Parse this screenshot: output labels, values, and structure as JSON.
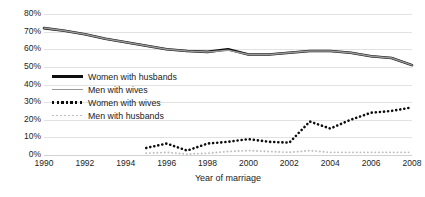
{
  "chart_data": {
    "type": "line",
    "title": "",
    "xlabel": "Year of marriage",
    "ylabel": "",
    "xlim": [
      1990,
      2008
    ],
    "ylim": [
      0,
      80
    ],
    "y_tick_labels": [
      "80%",
      "70%",
      "60%",
      "50%",
      "40%",
      "30%",
      "20%",
      "10%",
      "0%"
    ],
    "y_tick_values": [
      80,
      70,
      60,
      50,
      40,
      30,
      20,
      10,
      0
    ],
    "x_tick_labels": [
      "1990",
      "1992",
      "1994",
      "1996",
      "1998",
      "2000",
      "2002",
      "2004",
      "2006",
      "2008"
    ],
    "x_tick_values": [
      1990,
      1992,
      1994,
      1996,
      1998,
      2000,
      2002,
      2004,
      2006,
      2008
    ],
    "grid": "horizontal",
    "legend_position": "inside-left",
    "series": [
      {
        "name": "Women with husbands",
        "style": "solid-thick",
        "color": "#0d0d0d",
        "x": [
          1990,
          1991,
          1992,
          1993,
          1994,
          1995,
          1996,
          1997,
          1998,
          1999,
          2000,
          2001,
          2002,
          2003,
          2004,
          2005,
          2006,
          2007,
          2008
        ],
        "values": [
          72,
          70.5,
          68.5,
          66,
          64,
          62,
          60,
          59,
          58.5,
          60,
          57,
          57,
          58,
          59,
          59,
          58,
          56,
          55,
          51
        ]
      },
      {
        "name": "Men with wives",
        "style": "solid-thin",
        "color": "#9a9a9a",
        "x": [
          1990,
          1991,
          1992,
          1993,
          1994,
          1995,
          1996,
          1997,
          1998,
          1999,
          2000,
          2001,
          2002,
          2003,
          2004,
          2005,
          2006,
          2007,
          2008
        ],
        "values": [
          72,
          70.5,
          68.5,
          66,
          64,
          62,
          60,
          59,
          58.5,
          59.5,
          57,
          57,
          58,
          59,
          59,
          58,
          56,
          55,
          51
        ]
      },
      {
        "name": "Women with wives",
        "style": "dotted-thick",
        "color": "#0d0d0d",
        "x": [
          1995,
          1996,
          1997,
          1998,
          1999,
          2000,
          2001,
          2002,
          2003,
          2004,
          2005,
          2006,
          2007,
          2008
        ],
        "values": [
          4,
          6.5,
          2.5,
          6.5,
          7.5,
          9,
          7.5,
          7,
          19,
          15,
          20,
          24,
          25,
          27
        ]
      },
      {
        "name": "Men with husbands",
        "style": "dotted-thin",
        "color": "#bdbdbd",
        "x": [
          1995,
          1996,
          1997,
          1998,
          1999,
          2000,
          2001,
          2002,
          2003,
          2004,
          2005,
          2006,
          2007,
          2008
        ],
        "values": [
          1,
          1.5,
          0.5,
          1,
          2,
          2.5,
          2,
          1.5,
          2.5,
          1.5,
          1.5,
          1.5,
          1.5,
          1.5
        ]
      }
    ]
  },
  "legend": {
    "items": [
      {
        "label": "Women with husbands",
        "swatch": "sw-women-husbands"
      },
      {
        "label": "Men with wives",
        "swatch": "sw-men-wives"
      },
      {
        "label": "Women with wives",
        "swatch": "sw-women-wives"
      },
      {
        "label": "Men with husbands",
        "swatch": "sw-men-husbands"
      }
    ]
  }
}
